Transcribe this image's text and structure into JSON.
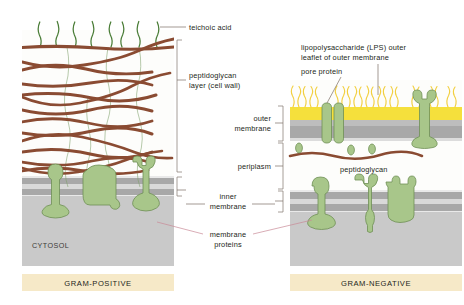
{
  "figure": {
    "panels": [
      {
        "id": "left",
        "banner": "GRAM-POSITIVE",
        "cytosol_label": "CYTOSOL"
      },
      {
        "id": "right",
        "banner": "GRAM-NEGATIVE"
      }
    ]
  },
  "labels": {
    "teichoic_acid": "teichoic acid",
    "peptidoglycan_layer_line1": "peptidoglycan",
    "peptidoglycan_layer_line2": "layer (cell wall)",
    "outer_membrane_line1": "outer",
    "outer_membrane_line2": "membrane",
    "periplasm": "periplasm",
    "inner_membrane_line1": "inner",
    "inner_membrane_line2": "membrane",
    "membrane_proteins_line1": "membrane",
    "membrane_proteins_line2": "proteins",
    "lps_line1": "lipopolysaccharide (LPS) outer",
    "lps_line2": "leaflet of outer membrane",
    "pore_protein": "pore protein",
    "peptidoglycan_right": "peptidoglycan"
  },
  "colors": {
    "banner_fill": "#f6e9c8",
    "banner_text": "#231f20",
    "cytosol_fill": "#c9c9c9",
    "membrane_leaflet": "#a8a8a8",
    "membrane_core": "#d7d7d7",
    "lps_yellow": "#f5e03c",
    "lps_strand": "#f2cf3f",
    "protein_fill": "#a8c68a",
    "protein_stroke": "#6f8f55",
    "peptidoglycan_strand": "#8a4b32",
    "teichoic_strand": "#4a7d37",
    "crosslink": "#7fa06a",
    "leader_line": "#7c6f64",
    "leader_pink": "#c98a96",
    "wall_background": "#fdfdfb"
  },
  "geometry": {
    "canvas_width": 464,
    "canvas_height": 305,
    "left_panel": {
      "x": 22,
      "y": 8,
      "width": 152,
      "height": 258
    },
    "right_panel": {
      "x": 290,
      "y": 80,
      "width": 172,
      "height": 186
    }
  }
}
